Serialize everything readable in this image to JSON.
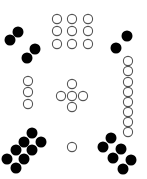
{
  "canvas": {
    "width": 147,
    "height": 179,
    "background": "#ffffff"
  },
  "style": {
    "filled_color": "#000000",
    "open_stroke": "#555555",
    "open_fill": "#ffffff",
    "filled_radius": 5.5,
    "open_radius": 4.6,
    "open_stroke_width": 1.1
  },
  "groups": [
    {
      "name": "top-left-filled-pairs",
      "kind": "filled",
      "count": 4,
      "points": [
        [
          18,
          32
        ],
        [
          10,
          40
        ],
        [
          35,
          49
        ],
        [
          27,
          58
        ]
      ]
    },
    {
      "name": "top-center-open-grid-3x3",
      "kind": "open",
      "count": 9,
      "points": [
        [
          57,
          19
        ],
        [
          72,
          19
        ],
        [
          88,
          19
        ],
        [
          57,
          31
        ],
        [
          72,
          31
        ],
        [
          88,
          31
        ],
        [
          57,
          44
        ],
        [
          72,
          44
        ],
        [
          88,
          44
        ]
      ]
    },
    {
      "name": "top-right-filled-pair",
      "kind": "filled",
      "count": 2,
      "points": [
        [
          127,
          36
        ],
        [
          116,
          48
        ]
      ]
    },
    {
      "name": "right-open-column",
      "kind": "open",
      "count": 8,
      "points": [
        [
          128,
          61
        ],
        [
          128,
          71
        ],
        [
          128,
          82
        ],
        [
          128,
          92
        ],
        [
          128,
          102
        ],
        [
          128,
          112
        ],
        [
          128,
          122
        ],
        [
          128,
          132
        ]
      ]
    },
    {
      "name": "left-open-column",
      "kind": "open",
      "count": 3,
      "points": [
        [
          28,
          81
        ],
        [
          28,
          92
        ],
        [
          28,
          104
        ]
      ]
    },
    {
      "name": "center-open-plus",
      "kind": "open",
      "count": 5,
      "points": [
        [
          72,
          84
        ],
        [
          61,
          96
        ],
        [
          72,
          96
        ],
        [
          83,
          96
        ],
        [
          72,
          107
        ]
      ]
    },
    {
      "name": "bottom-left-filled-cluster",
      "kind": "filled",
      "count": 8,
      "points": [
        [
          32,
          133
        ],
        [
          24,
          142
        ],
        [
          41,
          142
        ],
        [
          16,
          150
        ],
        [
          32,
          150
        ],
        [
          7,
          159
        ],
        [
          24,
          159
        ],
        [
          16,
          168
        ]
      ]
    },
    {
      "name": "bottom-center-open-single",
      "kind": "open",
      "count": 1,
      "points": [
        [
          72,
          147
        ]
      ]
    },
    {
      "name": "bottom-right-filled-cluster",
      "kind": "filled",
      "count": 6,
      "points": [
        [
          111,
          138
        ],
        [
          103,
          147
        ],
        [
          121,
          149
        ],
        [
          113,
          158
        ],
        [
          131,
          160
        ],
        [
          123,
          169
        ]
      ]
    }
  ],
  "totals": {
    "filled": 20,
    "open": 26
  }
}
